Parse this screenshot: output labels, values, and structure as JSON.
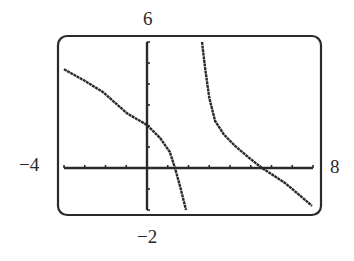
{
  "chart_data": {
    "type": "line",
    "title": "",
    "xlabel": "",
    "ylabel": "",
    "xlim": [
      -4,
      8
    ],
    "ylim": [
      -2,
      6
    ],
    "xscl": 1,
    "yscl": 1,
    "grid": false,
    "legend": null,
    "window_labels": {
      "ymax": "6",
      "ymin": "−2",
      "xmin": "−4",
      "xmax": "8"
    },
    "vertical_asymptote_x": 2.2,
    "series": [
      {
        "name": "left-branch",
        "x": [
          -4.0,
          -3.0,
          -2.1,
          -0.96,
          0.0,
          0.63,
          1.1,
          1.35,
          1.6,
          1.88
        ],
        "y": [
          4.7,
          4.15,
          3.6,
          2.6,
          2.05,
          1.43,
          0.76,
          0.0,
          -0.9,
          -2.0
        ]
      },
      {
        "name": "right-branch",
        "x": [
          2.65,
          2.8,
          3.0,
          3.28,
          3.7,
          4.24,
          4.9,
          5.54,
          6.65,
          7.95
        ],
        "y": [
          6.0,
          4.76,
          3.33,
          2.24,
          1.6,
          1.05,
          0.5,
          0.0,
          -0.71,
          -1.8
        ]
      }
    ]
  },
  "colors": {
    "ink": "#2a2a2a",
    "background": "#ffffff"
  }
}
